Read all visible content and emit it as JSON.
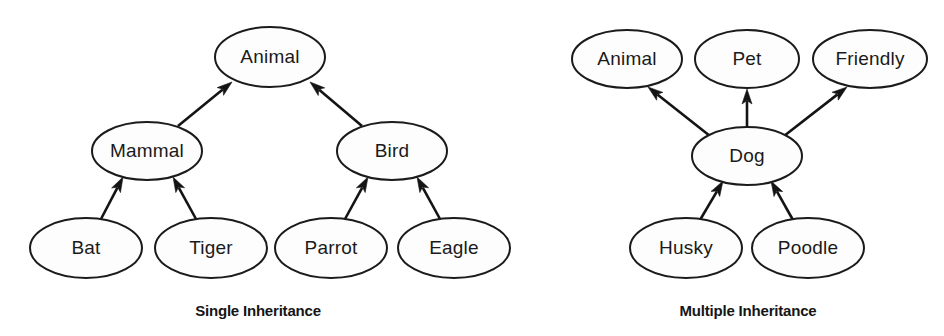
{
  "page": {
    "background_color": "#ffffff",
    "stroke_color": "#141414",
    "node_fill_color": "#fdfdfd",
    "text_color": "#1a1a1a"
  },
  "diagrams": [
    {
      "id": "single-inheritance",
      "caption": "Single Inheritance",
      "caption_center": {
        "x": 258,
        "y": 312
      },
      "nodes": [
        {
          "id": "animal",
          "label": "Animal",
          "cx": 270,
          "cy": 57,
          "rx": 55,
          "ry": 30
        },
        {
          "id": "mammal",
          "label": "Mammal",
          "cx": 147,
          "cy": 151,
          "rx": 55,
          "ry": 29
        },
        {
          "id": "bird",
          "label": "Bird",
          "cx": 392,
          "cy": 151,
          "rx": 55,
          "ry": 29
        },
        {
          "id": "bat",
          "label": "Bat",
          "cx": 86,
          "cy": 248,
          "rx": 56,
          "ry": 30
        },
        {
          "id": "tiger",
          "label": "Tiger",
          "cx": 211,
          "cy": 248,
          "rx": 56,
          "ry": 30
        },
        {
          "id": "parrot",
          "label": "Parrot",
          "cx": 331,
          "cy": 248,
          "rx": 56,
          "ry": 30
        },
        {
          "id": "eagle",
          "label": "Eagle",
          "cx": 454,
          "cy": 248,
          "rx": 56,
          "ry": 30
        }
      ],
      "edges": [
        {
          "id": "mammal-to-animal",
          "from": "mammal",
          "to": "animal",
          "x1": 178,
          "y1": 126,
          "x2": 232,
          "y2": 82
        },
        {
          "id": "bird-to-animal",
          "from": "bird",
          "to": "animal",
          "x1": 362,
          "y1": 126,
          "x2": 310,
          "y2": 82
        },
        {
          "id": "bat-to-mammal",
          "from": "bat",
          "to": "mammal",
          "x1": 101,
          "y1": 219,
          "x2": 123,
          "y2": 177
        },
        {
          "id": "tiger-to-mammal",
          "from": "tiger",
          "to": "mammal",
          "x1": 196,
          "y1": 219,
          "x2": 173,
          "y2": 177
        },
        {
          "id": "parrot-to-bird",
          "from": "parrot",
          "to": "bird",
          "x1": 345,
          "y1": 219,
          "x2": 368,
          "y2": 177
        },
        {
          "id": "eagle-to-bird",
          "from": "eagle",
          "to": "bird",
          "x1": 440,
          "y1": 219,
          "x2": 417,
          "y2": 177
        }
      ]
    },
    {
      "id": "multiple-inheritance",
      "caption": "Multiple Inheritance",
      "caption_center": {
        "x": 748,
        "y": 312
      },
      "nodes": [
        {
          "id": "animal2",
          "label": "Animal",
          "cx": 627,
          "cy": 59,
          "rx": 55,
          "ry": 29
        },
        {
          "id": "pet",
          "label": "Pet",
          "cx": 747,
          "cy": 59,
          "rx": 52,
          "ry": 29
        },
        {
          "id": "friendly",
          "label": "Friendly",
          "cx": 870,
          "cy": 59,
          "rx": 57,
          "ry": 29
        },
        {
          "id": "dog",
          "label": "Dog",
          "cx": 747,
          "cy": 156,
          "rx": 55,
          "ry": 29
        },
        {
          "id": "husky",
          "label": "Husky",
          "cx": 686,
          "cy": 248,
          "rx": 56,
          "ry": 30
        },
        {
          "id": "poodle",
          "label": "Poodle",
          "cx": 808,
          "cy": 248,
          "rx": 56,
          "ry": 30
        }
      ],
      "edges": [
        {
          "id": "dog-to-animal",
          "from": "dog",
          "to": "animal2",
          "x1": 710,
          "y1": 136,
          "x2": 648,
          "y2": 87
        },
        {
          "id": "dog-to-pet",
          "from": "dog",
          "to": "pet",
          "x1": 747,
          "y1": 127,
          "x2": 747,
          "y2": 89
        },
        {
          "id": "dog-to-friendly",
          "from": "dog",
          "to": "friendly",
          "x1": 784,
          "y1": 136,
          "x2": 847,
          "y2": 87
        },
        {
          "id": "husky-to-dog",
          "from": "husky",
          "to": "dog",
          "x1": 700,
          "y1": 220,
          "x2": 723,
          "y2": 181
        },
        {
          "id": "poodle-to-dog",
          "from": "poodle",
          "to": "dog",
          "x1": 793,
          "y1": 220,
          "x2": 771,
          "y2": 181
        }
      ]
    }
  ]
}
